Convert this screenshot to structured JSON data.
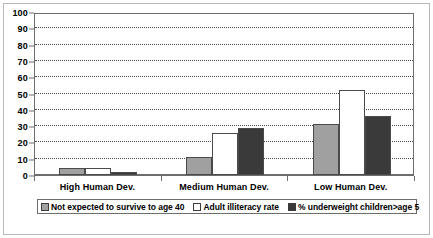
{
  "chart_data": {
    "type": "bar",
    "title": "",
    "subtitle": "",
    "xlabel": "",
    "ylabel": "",
    "categories": [
      "High Human Dev.",
      "Medium Human Dev.",
      "Low Human Dev."
    ],
    "series": [
      {
        "name": "Not expected to survive to age 40",
        "color": "#a0a0a0",
        "values": [
          4,
          11,
          31
        ]
      },
      {
        "name": "Adult illiteracy rate",
        "color": "#ffffff",
        "values": [
          4,
          26,
          52
        ]
      },
      {
        "name": "% underweight children>age 5",
        "color": "#3a3a3a",
        "values": [
          2,
          29,
          36
        ]
      }
    ],
    "ylim": [
      0,
      100
    ],
    "ytick_step": 10,
    "yticks": [
      0,
      10,
      20,
      30,
      40,
      50,
      60,
      70,
      80,
      90,
      100
    ],
    "ytick_labels": [
      "0",
      "10",
      "20",
      "30",
      "40",
      "50",
      "60",
      "70",
      "80",
      "90",
      "100"
    ],
    "grid": true,
    "grid_axis": "y",
    "grid_style": "dotted",
    "legend_position": "bottom"
  },
  "colors": {
    "series_1": "#a0a0a0",
    "series_2": "#ffffff",
    "series_3": "#3a3a3a",
    "bar_border": "#4a4a4a",
    "axis": "#6d6d6d",
    "grid": "#4a4a4a",
    "frame": "#b9b9b9",
    "text": "#000000",
    "background": "#ffffff"
  }
}
